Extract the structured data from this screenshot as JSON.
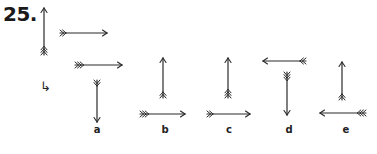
{
  "question": {
    "number": "25.",
    "hint_glyph": "↳"
  },
  "colors": {
    "stroke": "#2a2a2a",
    "text": "#1a1a1a"
  },
  "arrows": {
    "question": [
      {
        "x1": 44,
        "y1": 55,
        "x2": 44,
        "y2": 8,
        "fletch": 3
      },
      {
        "x1": 60,
        "y1": 33,
        "x2": 107,
        "y2": 33,
        "fletch": 2
      },
      {
        "x1": 75,
        "y1": 65,
        "x2": 122,
        "y2": 65,
        "fletch": 3
      }
    ],
    "a": [
      {
        "x1": 97,
        "y1": 80,
        "x2": 97,
        "y2": 122,
        "fletch": 2
      }
    ],
    "b": [
      {
        "x1": 163,
        "y1": 98,
        "x2": 163,
        "y2": 58,
        "fletch": 2
      },
      {
        "x1": 140,
        "y1": 114,
        "x2": 185,
        "y2": 114,
        "fletch": 3
      }
    ],
    "c": [
      {
        "x1": 228,
        "y1": 98,
        "x2": 228,
        "y2": 58,
        "fletch": 3
      },
      {
        "x1": 207,
        "y1": 114,
        "x2": 250,
        "y2": 114,
        "fletch": 2
      }
    ],
    "d": [
      {
        "x1": 306,
        "y1": 61,
        "x2": 263,
        "y2": 61,
        "fletch": 2
      },
      {
        "x1": 287,
        "y1": 72,
        "x2": 287,
        "y2": 115,
        "fletch": 3
      }
    ],
    "e": [
      {
        "x1": 342,
        "y1": 100,
        "x2": 342,
        "y2": 62,
        "fletch": 2
      },
      {
        "x1": 366,
        "y1": 113,
        "x2": 320,
        "y2": 113,
        "fletch": 3
      }
    ]
  },
  "options": [
    {
      "label": "a",
      "x": 97
    },
    {
      "label": "b",
      "x": 165
    },
    {
      "label": "c",
      "x": 229
    },
    {
      "label": "d",
      "x": 289
    },
    {
      "label": "e",
      "x": 346
    }
  ]
}
